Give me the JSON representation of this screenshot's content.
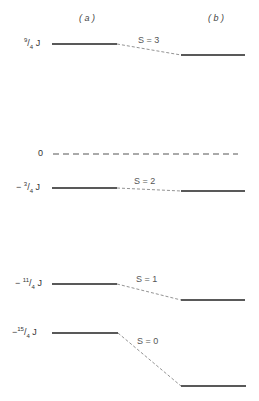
{
  "columns": {
    "a": "( a )",
    "b": "( b )"
  },
  "zero_label": "0",
  "levels": [
    {
      "energy_num": "9",
      "energy_den": "4",
      "sign": "",
      "unit": "J",
      "spin_label": "S = 3",
      "ya": 44,
      "yb": 55
    },
    {
      "energy_num": "3",
      "energy_den": "4",
      "sign": "−",
      "unit": "J",
      "spin_label": "S = 2",
      "ya": 188,
      "yb": 191
    },
    {
      "energy_num": "11",
      "energy_den": "4",
      "sign": "−",
      "unit": "J",
      "spin_label": "S = 1",
      "ya": 284,
      "yb": 300
    },
    {
      "energy_num": "15",
      "energy_den": "4",
      "sign": "−",
      "unit": "J",
      "spin_label": "S = 0",
      "ya": 333,
      "yb": 386
    }
  ],
  "colors": {
    "line": "#222222",
    "dash": "#777777"
  }
}
